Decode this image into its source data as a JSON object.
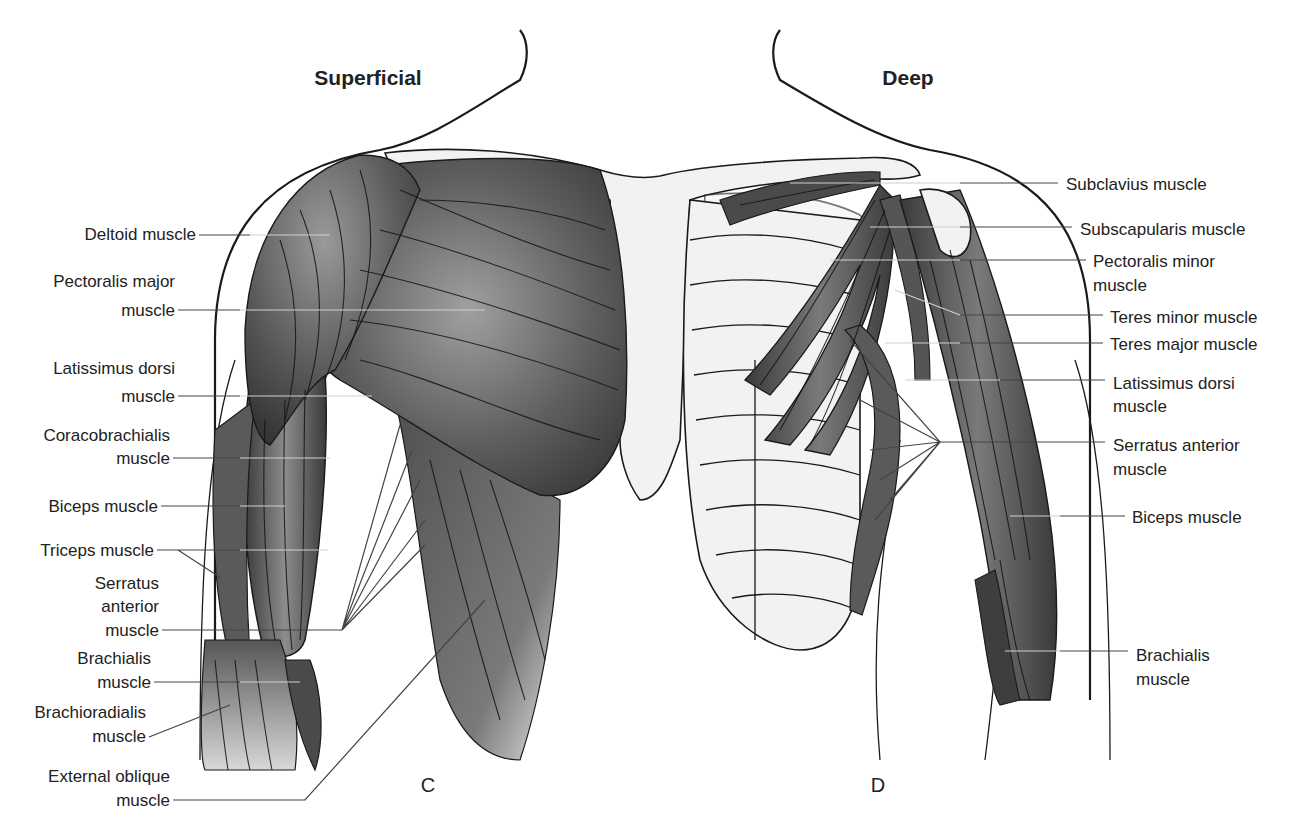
{
  "figure": {
    "left_title": "Superficial",
    "right_title": "Deep",
    "left_panel_letter": "C",
    "right_panel_letter": "D"
  },
  "colors": {
    "muscle_dark": "#3c3c3c",
    "muscle_mid": "#6e6e6e",
    "muscle_light": "#a8a8a8",
    "bone_fill": "#f2f2f2",
    "skin_fill": "#efefef",
    "outline": "#1a1a1a",
    "label_text": "#222222"
  },
  "superficial_labels": [
    {
      "id": "deltoid",
      "lines": [
        "Deltoid muscle"
      ]
    },
    {
      "id": "pectoralis-major",
      "lines": [
        "Pectoralis major",
        "muscle"
      ]
    },
    {
      "id": "latissimus-dorsi",
      "lines": [
        "Latissimus dorsi",
        "muscle"
      ]
    },
    {
      "id": "coracobrachialis",
      "lines": [
        "Coracobrachialis",
        "muscle"
      ]
    },
    {
      "id": "biceps",
      "lines": [
        "Biceps muscle"
      ]
    },
    {
      "id": "triceps",
      "lines": [
        "Triceps muscle"
      ]
    },
    {
      "id": "serratus-anterior",
      "lines": [
        "Serratus",
        "anterior",
        "muscle"
      ]
    },
    {
      "id": "brachialis",
      "lines": [
        "Brachialis",
        "muscle"
      ]
    },
    {
      "id": "brachioradialis",
      "lines": [
        "Brachioradialis",
        "muscle"
      ]
    },
    {
      "id": "external-oblique",
      "lines": [
        "External oblique",
        "muscle"
      ]
    }
  ],
  "deep_labels": [
    {
      "id": "subclavius",
      "lines": [
        "Subclavius muscle"
      ]
    },
    {
      "id": "subscapularis",
      "lines": [
        "Subscapularis muscle"
      ]
    },
    {
      "id": "pectoralis-minor",
      "lines": [
        "Pectoralis minor",
        "muscle"
      ]
    },
    {
      "id": "teres-minor",
      "lines": [
        "Teres minor muscle"
      ]
    },
    {
      "id": "teres-major",
      "lines": [
        "Teres major muscle"
      ]
    },
    {
      "id": "latissimus-dorsi",
      "lines": [
        "Latissimus dorsi",
        "muscle"
      ]
    },
    {
      "id": "serratus-anterior",
      "lines": [
        "Serratus anterior",
        "muscle"
      ]
    },
    {
      "id": "biceps",
      "lines": [
        "Biceps muscle"
      ]
    },
    {
      "id": "brachialis",
      "lines": [
        "Brachialis",
        "muscle"
      ]
    }
  ]
}
